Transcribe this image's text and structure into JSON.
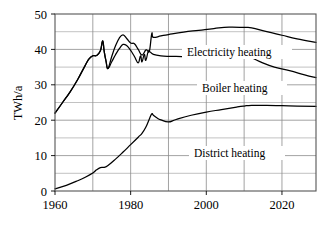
{
  "chart_data": {
    "type": "line",
    "title": "",
    "xlabel": "",
    "ylabel": "TWh/a",
    "xlim": [
      1960,
      2029
    ],
    "ylim": [
      0,
      50
    ],
    "grid": true,
    "legend_position": "inline-annotations",
    "x_ticks": [
      "1960",
      "1980",
      "2000",
      "2020"
    ],
    "x_tick_values": [
      1960,
      1980,
      2000,
      2020
    ],
    "x_gridline_values": [
      1960,
      1970,
      1980,
      1990,
      2000,
      2010,
      2020
    ],
    "y_ticks": [
      "0",
      "10",
      "20",
      "30",
      "40",
      "50"
    ],
    "y_tick_values": [
      0,
      10,
      20,
      30,
      40,
      50
    ],
    "y_minor_gridline_values": [
      5,
      15,
      25,
      35,
      45
    ],
    "series": [
      {
        "name": "Electricity heating",
        "annotation": "Electricity heating",
        "color": "#000000",
        "x": [
          1960,
          1962,
          1964,
          1966,
          1968,
          1969,
          1970,
          1971,
          1972,
          1972.6,
          1973,
          1973.5,
          1974,
          1975,
          1976,
          1977,
          1978,
          1979,
          1980,
          1981,
          1982,
          1983,
          1984,
          1984.5,
          1985,
          1985.6,
          1986,
          1988,
          1990,
          1994,
          1998,
          2002,
          2006,
          2010,
          2012,
          2016,
          2020,
          2024,
          2029
        ],
        "y": [
          22.0,
          25.0,
          28.0,
          31.5,
          35.5,
          37.3,
          38.2,
          38.3,
          39.6,
          42.4,
          39.5,
          36.6,
          34.6,
          38.0,
          41.0,
          43.2,
          44.1,
          43.0,
          41.8,
          41.6,
          40.0,
          38.4,
          39.8,
          39.6,
          39.7,
          44.5,
          43.4,
          43.8,
          44.2,
          44.9,
          45.4,
          45.9,
          46.3,
          46.2,
          46.1,
          45.0,
          44.0,
          43.0,
          42.0
        ]
      },
      {
        "name": "Boiler heating",
        "annotation": "Boiler heating",
        "color": "#000000",
        "x": [
          1960,
          1962,
          1964,
          1966,
          1968,
          1969,
          1970,
          1971,
          1972,
          1972.6,
          1973,
          1973.5,
          1974,
          1975,
          1976,
          1977,
          1978,
          1979,
          1980,
          1981,
          1982,
          1982.6,
          1983,
          1983.6,
          1984,
          1984.6,
          1985,
          1986,
          1988,
          1992,
          1996,
          2000,
          2004,
          2008,
          2010,
          2012,
          2014,
          2018,
          2022,
          2026,
          2029
        ],
        "y": [
          22.0,
          25.0,
          28.0,
          31.5,
          35.5,
          37.3,
          38.2,
          38.3,
          39.6,
          42.4,
          39.5,
          36.6,
          34.6,
          36.5,
          38.5,
          40.2,
          41.4,
          41.0,
          39.7,
          38.0,
          36.2,
          38.2,
          36.5,
          38.6,
          36.9,
          39.3,
          39.4,
          38.6,
          38.2,
          38.0,
          38.0,
          38.0,
          38.0,
          38.0,
          38.0,
          37.6,
          36.6,
          35.0,
          34.0,
          32.8,
          32.0
        ]
      },
      {
        "name": "District heating",
        "annotation": "District heating",
        "color": "#000000",
        "x": [
          1960,
          1963,
          1966,
          1968,
          1970,
          1971,
          1972,
          1973,
          1974,
          1976,
          1978,
          1980,
          1982,
          1983,
          1984,
          1985,
          1985.6,
          1986,
          1987,
          1988,
          1990,
          1992,
          1996,
          2000,
          2004,
          2008,
          2010,
          2012,
          2016,
          2020,
          2024,
          2029
        ],
        "y": [
          0.6,
          1.6,
          2.9,
          3.9,
          5.1,
          6.0,
          6.6,
          6.7,
          7.2,
          9.0,
          11.0,
          13.1,
          15.2,
          16.3,
          18.0,
          20.5,
          21.8,
          21.4,
          20.6,
          20.1,
          19.5,
          20.2,
          21.4,
          22.3,
          23.0,
          23.7,
          24.0,
          24.2,
          24.2,
          24.1,
          24.0,
          23.9
        ]
      }
    ]
  },
  "annotations": {
    "electricity": "Electricity heating",
    "boiler": "Boiler heating",
    "district": "District heating"
  },
  "axis": {
    "y_title": "TWh/a"
  }
}
